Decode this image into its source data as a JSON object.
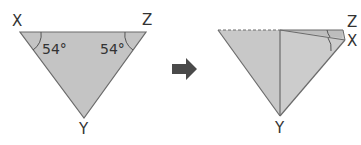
{
  "diagram": {
    "colors": {
      "fill": "#c4c4c4",
      "fill_light": "#cfcfcf",
      "stroke": "#6b6b6b",
      "text": "#333333",
      "arrow": "#4a4a4a"
    },
    "left_triangle": {
      "vertices": {
        "x": "X",
        "z": "Z",
        "y": "Y"
      },
      "angles": {
        "at_x": "54°",
        "at_z": "54°"
      }
    },
    "arrow": {
      "icon": "right-arrow-icon"
    },
    "right_triangle": {
      "vertices": {
        "z": "Z",
        "x": "X",
        "y": "Y"
      }
    }
  }
}
